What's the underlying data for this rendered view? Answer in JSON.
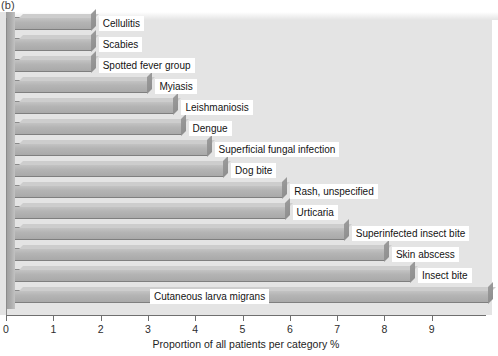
{
  "figure": {
    "panel_label": "(b)",
    "background_color": "#e4e4e4",
    "bar_color": "#b4b4b4"
  },
  "chart_data": {
    "type": "bar",
    "orientation": "horizontal",
    "title": "",
    "xlabel": "Proportion of all patients per category %",
    "ylabel": "",
    "xlim": [
      0,
      10.15
    ],
    "ylim": [
      0,
      14
    ],
    "grid": false,
    "legend": "none",
    "xticks": [
      0,
      1,
      2,
      3,
      4,
      5,
      6,
      7,
      8,
      9
    ],
    "xticklabels": [
      "0",
      "1",
      "2",
      "3",
      "4",
      "5",
      "6",
      "7",
      "8",
      "9"
    ],
    "categories": [
      "Cellulitis",
      "Scabies",
      "Spotted fever group",
      "Myiasis",
      "Leishmaniosis",
      "Dengue",
      "Superficial fungal infection",
      "Dog bite",
      "Rash, unspecified",
      "Urticaria",
      "Superinfected insect bite",
      "Skin abscess",
      "Insect bite",
      "Cutaneous larva migrans"
    ],
    "values": [
      1.6,
      1.6,
      1.6,
      2.8,
      3.35,
      3.5,
      4.05,
      4.4,
      5.65,
      5.7,
      6.95,
      7.8,
      8.35,
      10.0
    ],
    "labels_inside": [
      false,
      false,
      false,
      false,
      false,
      false,
      false,
      false,
      false,
      false,
      false,
      false,
      false,
      true
    ]
  }
}
